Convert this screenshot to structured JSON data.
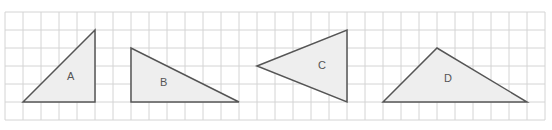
{
  "grid": {
    "x0": 5,
    "y0": 12,
    "cell": 18,
    "cols": 30,
    "rows": 6,
    "line_color": "#d4d4d4"
  },
  "style": {
    "stroke": "#555555",
    "fill": "#eeeeee"
  },
  "triangles": [
    {
      "label": "A",
      "points": [
        [
          23,
          102
        ],
        [
          95,
          30
        ],
        [
          95,
          102
        ]
      ],
      "label_pos": [
        67,
        80
      ]
    },
    {
      "label": "B",
      "points": [
        [
          131,
          48
        ],
        [
          131,
          102
        ],
        [
          239,
          102
        ]
      ],
      "label_pos": [
        160,
        86
      ]
    },
    {
      "label": "C",
      "points": [
        [
          257,
          66
        ],
        [
          347,
          30
        ],
        [
          347,
          102
        ]
      ],
      "label_pos": [
        318,
        69
      ]
    },
    {
      "label": "D",
      "points": [
        [
          383,
          102
        ],
        [
          437,
          48
        ],
        [
          527,
          102
        ]
      ],
      "label_pos": [
        444,
        82
      ]
    }
  ]
}
